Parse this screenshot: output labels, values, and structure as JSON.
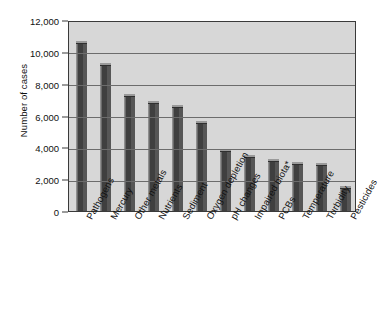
{
  "chart_data": {
    "type": "bar",
    "title": "",
    "xlabel": "",
    "ylabel": "Number of cases",
    "ylim": [
      0,
      12000
    ],
    "yticks": [
      "0",
      "2,000",
      "4,000",
      "6,000",
      "8,000",
      "10,000",
      "12,000"
    ],
    "ytick_values": [
      0,
      2000,
      4000,
      6000,
      8000,
      10000,
      12000
    ],
    "grid": true,
    "legend": "none",
    "bar_color": "#4b4b4b",
    "plot_background": "#d7d7d7",
    "categories": [
      "Pathogens",
      "Mercury",
      "Other metals",
      "Nutrients",
      "Sediment",
      "Oxygen depletion",
      "pH changes",
      "Impaired biota*",
      "PCBs",
      "Temperature",
      "Turbidity",
      "Pesticides"
    ],
    "values": [
      10500,
      9100,
      7150,
      6700,
      6450,
      5450,
      3700,
      3350,
      3050,
      2900,
      2800,
      1400
    ]
  }
}
